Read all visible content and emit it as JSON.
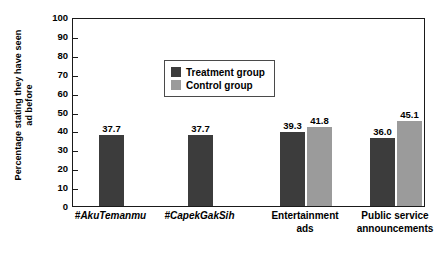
{
  "chart_data": {
    "type": "bar",
    "title": "",
    "subtitle": "",
    "xlabel": "",
    "ylabel_line1": "Percentage stating they have seen",
    "ylabel_line2": "ad before",
    "ylim": [
      0,
      100
    ],
    "yticks": [
      0,
      10,
      20,
      30,
      40,
      50,
      60,
      70,
      80,
      90,
      100
    ],
    "ytick_labels": [
      "0",
      "10",
      "20",
      "30",
      "40",
      "50",
      "60",
      "70",
      "80",
      "90",
      "100"
    ],
    "grid": false,
    "legend_position": "upper-left-inside",
    "categories": [
      {
        "line1": "#AkuTemanmu",
        "line2": "",
        "italic": true
      },
      {
        "line1": "#CapekGakSih",
        "line2": "",
        "italic": true
      },
      {
        "line1": "Entertainment",
        "line2": "ads",
        "italic": false
      },
      {
        "line1": "Public service",
        "line2": "announcements",
        "italic": false
      }
    ],
    "series": [
      {
        "name": "Treatment group",
        "color": "#3c3c3c",
        "values": [
          37.7,
          37.7,
          39.3,
          36.0
        ],
        "labels": [
          "37.7",
          "37.7",
          "39.3",
          "36.0"
        ]
      },
      {
        "name": "Control group",
        "color": "#9b9b9b",
        "values": [
          null,
          null,
          41.8,
          45.1
        ],
        "labels": [
          "",
          "",
          "41.8",
          "45.1"
        ]
      }
    ],
    "colors": {
      "treatment": "#3c3c3c",
      "control": "#9b9b9b",
      "axis": "#1a1a1a",
      "background": "#ffffff",
      "legend_border": "#4a4a4a"
    }
  }
}
